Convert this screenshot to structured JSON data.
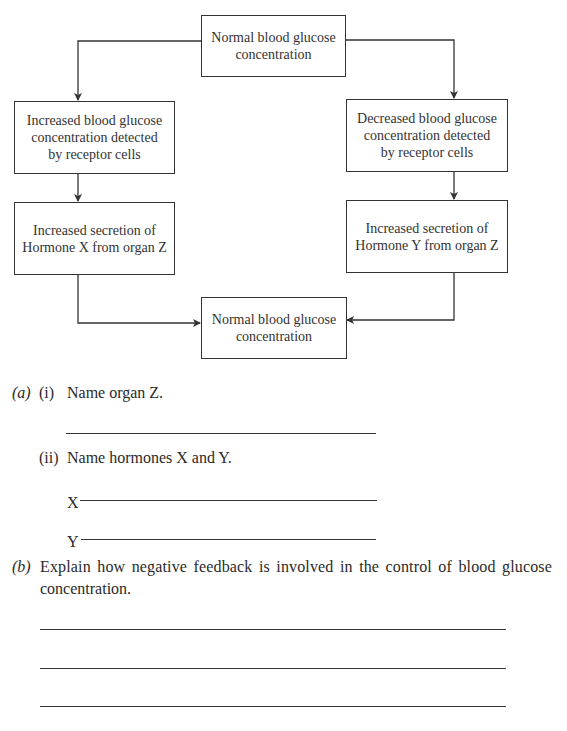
{
  "diagram": {
    "boxes": {
      "top": "Normal blood glucose\nconcentration",
      "left_detect": "Increased blood glucose\nconcentration detected\nby receptor cells",
      "right_detect": "Decreased blood glucose\nconcentration detected\nby receptor cells",
      "left_secrete": "Increased secretion of\nHormone X from organ Z",
      "right_secrete": "Increased secretion of\nHormone Y from organ Z",
      "bottom": "Normal blood glucose\nconcentration"
    }
  },
  "questions": {
    "a": {
      "label": "(a)",
      "i": {
        "num": "(i)",
        "text": "Name organ Z."
      },
      "ii": {
        "num": "(ii)",
        "text": "Name hormones X and Y.",
        "x_label": "X",
        "y_label": "Y"
      }
    },
    "b": {
      "label": "(b)",
      "text_line1": "Explain how negative feedback is involved in the control of blood glucose",
      "text_line2": "concentration."
    }
  }
}
